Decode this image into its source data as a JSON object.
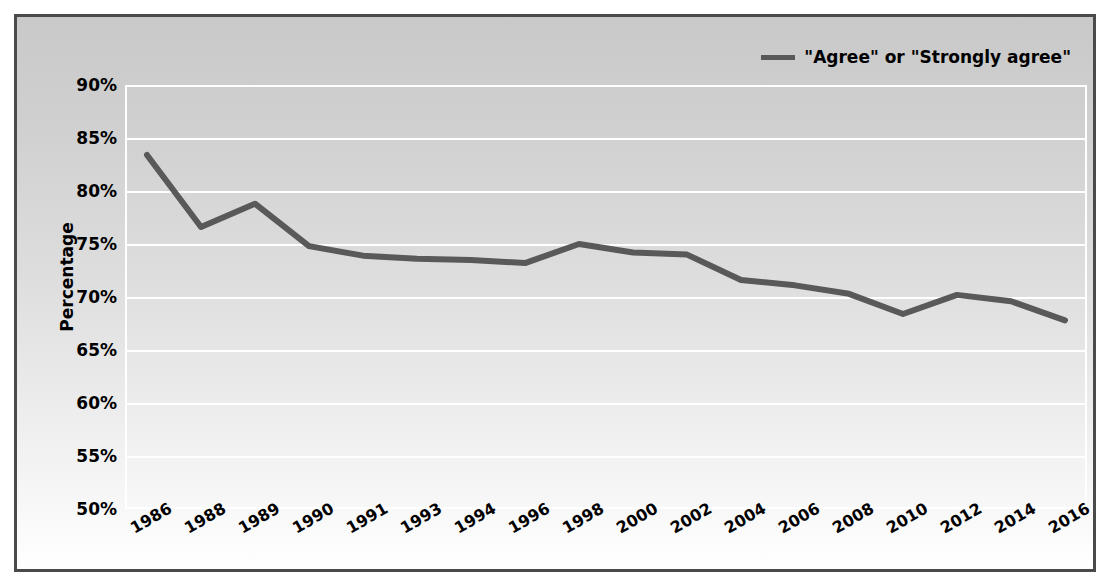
{
  "chart_data": {
    "type": "line",
    "title": "",
    "xlabel": "",
    "ylabel": "Percentage",
    "categories": [
      "1986",
      "1988",
      "1989",
      "1990",
      "1991",
      "1993",
      "1994",
      "1996",
      "1998",
      "2000",
      "2002",
      "2004",
      "2006",
      "2008",
      "2010",
      "2012",
      "2014",
      "2016"
    ],
    "series": [
      {
        "name": "\"Agree\" or \"Strongly agree\"",
        "color": "#595959",
        "values": [
          83.4,
          76.6,
          78.8,
          74.8,
          73.9,
          73.6,
          73.5,
          73.2,
          75.0,
          74.2,
          74.0,
          71.6,
          71.1,
          70.3,
          68.4,
          70.2,
          69.6,
          67.8
        ]
      }
    ],
    "ylim": [
      50,
      90
    ],
    "ytick_values": [
      90,
      85,
      80,
      75,
      70,
      65,
      60,
      55,
      50
    ],
    "ytick_labels": [
      "90%",
      "85%",
      "80%",
      "75%",
      "70%",
      "65%",
      "60%",
      "55%",
      "50%"
    ],
    "grid": true,
    "grid_color": "#ffffff",
    "legend_position": "top-right",
    "plot_background": "gradient gray to white",
    "frame_border_color": "#4a4a4a"
  },
  "legend": {
    "entries": [
      {
        "label": "\"Agree\" or \"Strongly agree\"",
        "color": "#595959"
      }
    ]
  },
  "axes": {
    "y_title": "Percentage"
  }
}
